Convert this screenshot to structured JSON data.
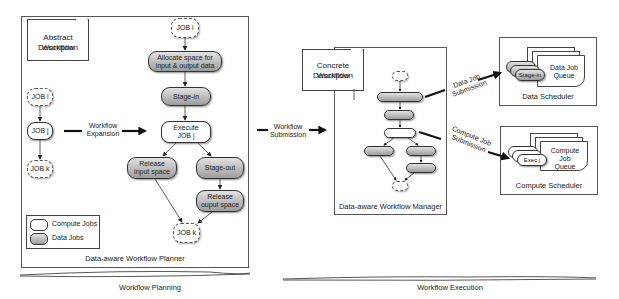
{
  "planner": {
    "title": "Data-aware Workflow Planner",
    "abstract_doc": {
      "line1": "Abstract Workflow",
      "line2": "Description"
    },
    "abstract_jobs": {
      "job_i": "JOB i",
      "job_j": "JOB j",
      "job_k": "JOB k"
    },
    "expansion_label": {
      "line1": "Workflow",
      "line2": "Expansion"
    },
    "expanded": {
      "job_i": "JOB i",
      "allocate": {
        "line1": "Allocate space for",
        "line2": "input & output data"
      },
      "stage_in": "Stage-in",
      "execute": {
        "line1": "Execute",
        "line2": "JOB j"
      },
      "release_input": {
        "line1": "Release",
        "line2": "input space"
      },
      "stage_out": "Stage-out",
      "release_output": {
        "line1": "Release",
        "line2": "ouput space"
      },
      "job_k": "JOB k"
    },
    "legend": {
      "compute": "Compute Jobs",
      "data": "Data Jobs"
    }
  },
  "submission_label": {
    "line1": "Workflow",
    "line2": "Submission"
  },
  "manager": {
    "title": "Data-aware Workflow Manager",
    "concrete_doc": {
      "line1": "Concrete Workflow",
      "line2": "Description"
    }
  },
  "data_submission": {
    "line1": "Data Job",
    "line2": "Submission"
  },
  "compute_submission": {
    "line1": "Compute Job",
    "line2": "Submission"
  },
  "data_scheduler": {
    "title": "Data Scheduler",
    "queue": {
      "line1": "Data Job",
      "line2": "Queue"
    },
    "job": "Stage-in"
  },
  "compute_scheduler": {
    "title": "Compute Scheduler",
    "queue": {
      "line1": "Compute Job",
      "line2": "Queue"
    },
    "job": "Exec j"
  },
  "phases": {
    "planning": "Workflow Planning",
    "execution": "Workflow Execution"
  }
}
